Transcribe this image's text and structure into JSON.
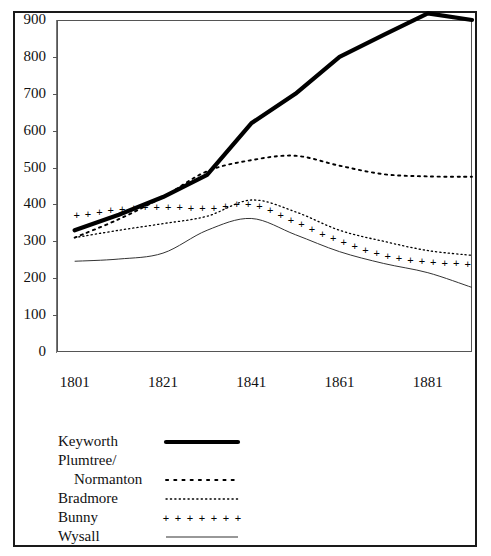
{
  "figure": {
    "border_color": "#1a1a1a",
    "background": "#ffffff"
  },
  "chart_data": {
    "type": "line",
    "title": "",
    "subtitle": "",
    "xlabel": "",
    "ylabel": "",
    "xlim": [
      1797,
      1891
    ],
    "ylim": [
      0,
      900
    ],
    "grid": false,
    "legend_position": "below-left",
    "x_tick_labels": [
      "1801",
      "1821",
      "1841",
      "1861",
      "1881"
    ],
    "x_ticks": [
      1801,
      1821,
      1841,
      1861,
      1881
    ],
    "y_tick_labels": [
      "0",
      "100",
      "200",
      "300",
      "400",
      "500",
      "600",
      "700",
      "800",
      "900"
    ],
    "y_ticks": [
      0,
      100,
      200,
      300,
      400,
      500,
      600,
      700,
      800,
      900
    ],
    "x": [
      1801,
      1811,
      1821,
      1831,
      1841,
      1851,
      1861,
      1871,
      1881,
      1891
    ],
    "series": [
      {
        "name": "Keyworth",
        "style": "thick-solid",
        "color": "#000000",
        "values": [
          330,
          372,
          420,
          480,
          620,
          700,
          800,
          860,
          918,
          900
        ]
      },
      {
        "name": "Plumtree/ Normanton",
        "style": "dotted",
        "color": "#000000",
        "values": [
          310,
          360,
          420,
          490,
          520,
          532,
          505,
          482,
          476,
          475
        ]
      },
      {
        "name": "Bradmore",
        "style": "fine-dotted",
        "color": "#000000",
        "values": [
          310,
          330,
          348,
          368,
          412,
          380,
          330,
          300,
          275,
          262
        ]
      },
      {
        "name": "Bunny",
        "style": "plus-markers",
        "color": "#000000",
        "values": [
          368,
          385,
          392,
          388,
          400,
          352,
          300,
          262,
          243,
          237
        ]
      },
      {
        "name": "Wysall",
        "style": "thin-solid",
        "color": "#000000",
        "values": [
          246,
          252,
          268,
          330,
          362,
          318,
          272,
          240,
          215,
          175
        ]
      }
    ]
  },
  "legend": {
    "rows": [
      {
        "label": "Keyworth",
        "indent": false,
        "style": "thick-solid"
      },
      {
        "label": "Plumtree/",
        "indent": false,
        "style": "none"
      },
      {
        "label": "Normanton",
        "indent": true,
        "style": "dotted"
      },
      {
        "label": "Bradmore",
        "indent": false,
        "style": "fine-dotted"
      },
      {
        "label": "Bunny",
        "indent": false,
        "style": "plus-markers"
      },
      {
        "label": "Wysall",
        "indent": false,
        "style": "thin-solid"
      }
    ]
  }
}
